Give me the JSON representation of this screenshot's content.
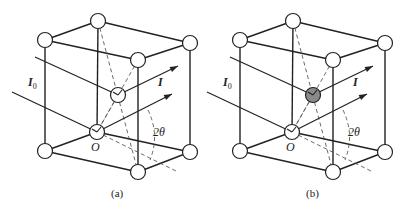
{
  "figure": {
    "panels": [
      {
        "id": "a",
        "caption": "(a)",
        "offset_x": 0,
        "center_atom_fill": "#ffffff",
        "labels": {
          "incident": "I",
          "incident_sub": "0",
          "diffracted": "I",
          "origin": "O",
          "angle": "2θ"
        }
      },
      {
        "id": "b",
        "caption": "(b)",
        "offset_x": 195,
        "center_atom_fill": "#8a8a8a",
        "labels": {
          "incident": "I",
          "incident_sub": "0",
          "diffracted": "I",
          "origin": "O",
          "angle": "2θ"
        }
      }
    ],
    "geometry": {
      "atom_radius": 7.5,
      "corners": {
        "top_back": [
          98,
          21
        ],
        "top_left": [
          45,
          40
        ],
        "top_right": [
          190,
          43
        ],
        "top_front": [
          138,
          60
        ],
        "bottom_left": [
          45,
          151
        ],
        "bottom_right": [
          190,
          152
        ],
        "bottom_front": [
          138,
          172
        ],
        "origin": [
          97,
          132
        ]
      },
      "center_atom": [
        118,
        95
      ],
      "rays": {
        "incident_upper": [
          [
            35,
            57
          ],
          [
            118,
            95
          ]
        ],
        "incident_lower": [
          [
            12,
            92
          ],
          [
            97,
            132
          ]
        ],
        "diffracted_upper": [
          [
            118,
            95
          ],
          [
            178,
            66
          ]
        ],
        "diffracted_lower": [
          [
            97,
            132
          ],
          [
            172,
            94
          ]
        ],
        "transmitted_dashed": [
          [
            97,
            132
          ],
          [
            178,
            172
          ]
        ]
      },
      "label_positions": {
        "incident": [
          28,
          76
        ],
        "diffracted": [
          158,
          76
        ],
        "origin": [
          91,
          141
        ],
        "angle": [
          153,
          126
        ],
        "caption": [
          111,
          188
        ]
      }
    },
    "colors": {
      "line": "#222222",
      "background": "#ffffff",
      "filled_atom": "#8a8a8a"
    }
  }
}
